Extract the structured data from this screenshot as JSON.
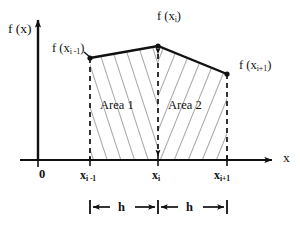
{
  "figure": {
    "background_color": "#ffffff",
    "ink_color": "#111111",
    "hatch_color": "#5a5a5a"
  },
  "axes": {
    "y_axis_label": "f (x)",
    "x_axis_label": "x",
    "origin_label": "0",
    "x_axis_y": 160,
    "y_axis_x": 38,
    "x_axis_start": 20,
    "x_axis_end": 278,
    "y_axis_top": 14
  },
  "curve": {
    "points": [
      {
        "name": "left-vertex",
        "x": 90,
        "y": 58,
        "value_label": "f (x",
        "sub": "i -1",
        "close": ")"
      },
      {
        "name": "peak-vertex",
        "x": 158,
        "y": 46,
        "value_label": "f (x",
        "sub": "i",
        "close": ")"
      },
      {
        "name": "right-vertex",
        "x": 227,
        "y": 74,
        "value_label": "f (x",
        "sub": "i+1",
        "close": ")"
      }
    ]
  },
  "function_labels": [
    {
      "name": "f-x-i-minus-1",
      "prefix": "f (x",
      "sub": "i -1",
      "suffix": ")",
      "x": 52,
      "y": 42
    },
    {
      "name": "f-x-i",
      "prefix": "f (x",
      "sub": "i",
      "suffix": ")",
      "x": 157,
      "y": 10
    },
    {
      "name": "f-x-i-plus-1",
      "prefix": "f (x",
      "sub": "i+1",
      "suffix": ")",
      "x": 239,
      "y": 59
    }
  ],
  "tick_labels": [
    {
      "name": "tick-x-i-minus-1",
      "prefix": "x",
      "sub": "i -1",
      "x": 80,
      "y": 168
    },
    {
      "name": "tick-x-i",
      "prefix": "x",
      "sub": "i",
      "x": 152,
      "y": 168
    },
    {
      "name": "tick-x-i-plus-1",
      "prefix": "x",
      "sub": "i+1",
      "x": 214,
      "y": 168
    }
  ],
  "regions": [
    {
      "name": "area-1",
      "label": "Area 1",
      "x": 100,
      "y": 105,
      "hatch": "up"
    },
    {
      "name": "area-2",
      "label": "Area 2",
      "x": 168,
      "y": 105,
      "hatch": "down"
    }
  ],
  "dimensions": {
    "y": 207,
    "tick_half_height": 7,
    "segments": [
      {
        "name": "dimension-h-left",
        "label": "h",
        "from_x": 90,
        "to_x": 158,
        "label_x": 118,
        "label_y": 201
      },
      {
        "name": "dimension-h-right",
        "label": "h",
        "from_x": 158,
        "to_x": 227,
        "label_x": 186,
        "label_y": 201
      }
    ]
  }
}
